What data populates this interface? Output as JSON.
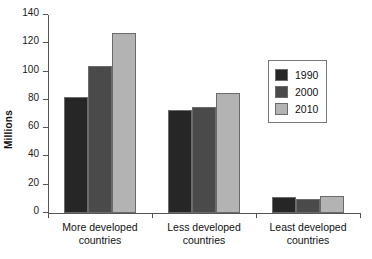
{
  "chart_data": {
    "type": "bar",
    "title": "",
    "xlabel": "",
    "ylabel": "Millions",
    "ylim": [
      0,
      140
    ],
    "yticks": [
      0,
      20,
      40,
      60,
      80,
      100,
      120,
      140
    ],
    "grid": false,
    "legend_position": "upper-right-inside",
    "categories": [
      "More developed\ncountries",
      "Less developed\ncountries",
      "Least developed\ncountries"
    ],
    "series": [
      {
        "name": "1990",
        "color": "#262626",
        "values": [
          82,
          73,
          11
        ]
      },
      {
        "name": "2000",
        "color": "#4a4a4a",
        "values": [
          104,
          75,
          10
        ]
      },
      {
        "name": "2010",
        "color": "#b3b3b3",
        "values": [
          127,
          85,
          12
        ]
      }
    ]
  },
  "axis": {
    "y_title": "Millions",
    "y_tick_labels": [
      "0",
      "20",
      "40",
      "60",
      "80",
      "100",
      "120",
      "140"
    ]
  },
  "legend": {
    "items": [
      {
        "label": "1990"
      },
      {
        "label": "2000"
      },
      {
        "label": "2010"
      }
    ]
  },
  "categories": [
    {
      "line1": "More developed",
      "line2": "countries"
    },
    {
      "line1": "Less developed",
      "line2": "countries"
    },
    {
      "line1": "Least developed",
      "line2": "countries"
    }
  ]
}
